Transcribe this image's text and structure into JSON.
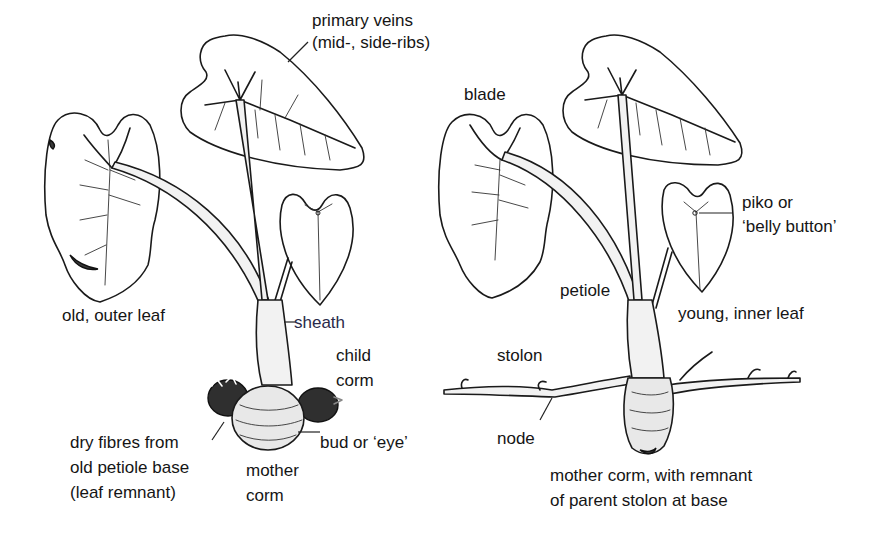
{
  "figure": {
    "left_plant": {
      "labels": {
        "primary_veins_line1": "primary veins",
        "primary_veins_line2": "(mid-, side-ribs)",
        "old_outer_leaf": "old, outer leaf",
        "sheath": "sheath",
        "child_corm_line1": "child",
        "child_corm_line2": "corm",
        "dry_fibres_line1": "dry fibres from",
        "dry_fibres_line2": "old petiole base",
        "dry_fibres_line3": "(leaf remnant)",
        "bud_or_eye": "bud or ‘eye’",
        "mother_corm_line1": "mother",
        "mother_corm_line2": "corm"
      }
    },
    "right_plant": {
      "labels": {
        "blade": "blade",
        "piko_line1": "piko or",
        "piko_line2": "‘belly button’",
        "petiole": "petiole",
        "young_inner_leaf": "young, inner leaf",
        "stolon": "stolon",
        "node": "node",
        "mother_corm_line1": "mother corm, with remnant",
        "mother_corm_line2": "of parent stolon at base"
      }
    }
  }
}
